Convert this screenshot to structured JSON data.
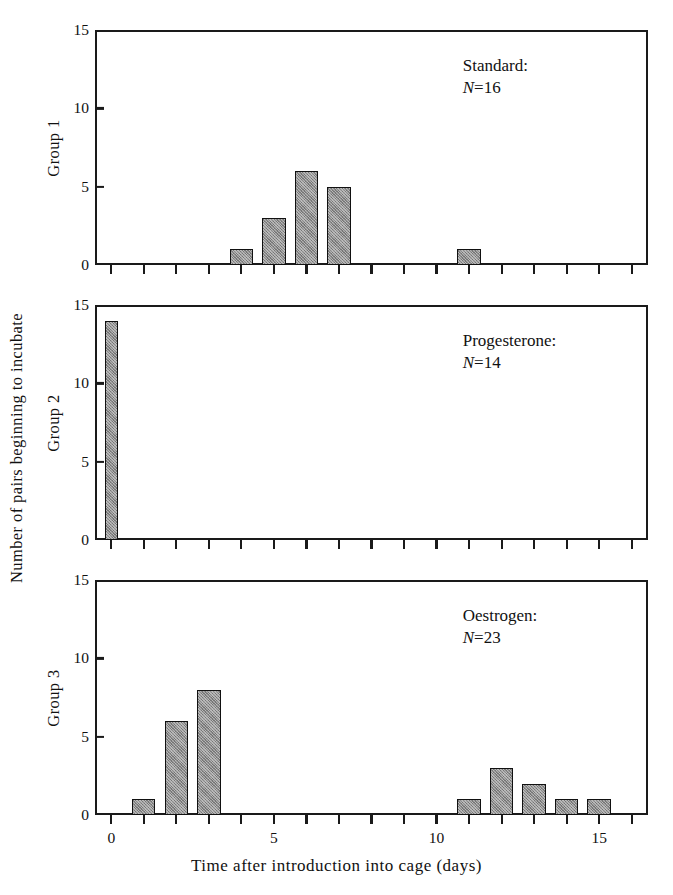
{
  "chart_data": {
    "type": "bar",
    "title": "",
    "xlabel": "Time after introduction into cage (days)",
    "ylabel": "Number of pairs beginning to incubate",
    "xlim": [
      -0.5,
      16.5
    ],
    "ylim": [
      0,
      15
    ],
    "yticks": [
      0,
      5,
      10,
      15
    ],
    "ytick_labels": [
      "0",
      "5",
      "10",
      "15"
    ],
    "xticks": [
      0,
      1,
      2,
      3,
      4,
      5,
      6,
      7,
      8,
      9,
      10,
      11,
      12,
      13,
      14,
      15,
      16
    ],
    "xtick_labels_shown": [
      {
        "value": 0,
        "label": "0"
      },
      {
        "value": 5,
        "label": "5"
      },
      {
        "value": 10,
        "label": "10"
      },
      {
        "value": 15,
        "label": "15"
      }
    ],
    "grid": false,
    "legend": "none",
    "bar_color": "#8c8c8c",
    "bar_edge_color": "#111111",
    "axis_color": "#1a1a1a",
    "panels": [
      {
        "id": "group-1",
        "row_label": "Group 1",
        "treatment": "Standard:",
        "n_prefix": "N",
        "n_eq": "=",
        "n_value": "16",
        "x": [
          0,
          1,
          2,
          3,
          4,
          5,
          6,
          7,
          8,
          9,
          10,
          11,
          12,
          13,
          14,
          15,
          16
        ],
        "values": [
          0,
          0,
          0,
          0,
          1,
          3,
          6,
          5,
          0,
          0,
          0,
          1,
          0,
          0,
          0,
          0,
          0
        ]
      },
      {
        "id": "group-2",
        "row_label": "Group 2",
        "treatment": "Progesterone:",
        "n_prefix": "N",
        "n_eq": "=",
        "n_value": "14",
        "x": [
          0,
          1,
          2,
          3,
          4,
          5,
          6,
          7,
          8,
          9,
          10,
          11,
          12,
          13,
          14,
          15,
          16
        ],
        "values": [
          14,
          0,
          0,
          0,
          0,
          0,
          0,
          0,
          0,
          0,
          0,
          0,
          0,
          0,
          0,
          0,
          0
        ]
      },
      {
        "id": "group-3",
        "row_label": "Group 3",
        "treatment": "Oestrogen:",
        "n_prefix": "N",
        "n_eq": "=",
        "n_value": "23",
        "x": [
          0,
          1,
          2,
          3,
          4,
          5,
          6,
          7,
          8,
          9,
          10,
          11,
          12,
          13,
          14,
          15,
          16
        ],
        "values": [
          0,
          1,
          6,
          8,
          0,
          0,
          0,
          0,
          0,
          0,
          0,
          1,
          3,
          2,
          1,
          1,
          0
        ]
      }
    ]
  }
}
